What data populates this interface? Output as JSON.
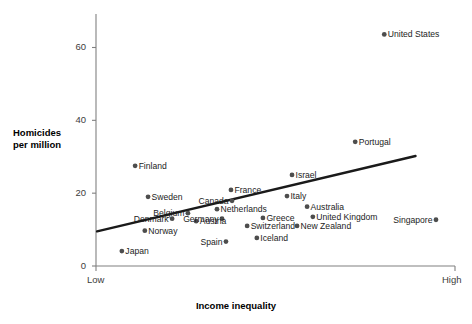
{
  "chart_data": {
    "type": "scatter",
    "title": "",
    "xlabel": "Income inequality",
    "ylabel": "Homicides\nper million",
    "ylabel_line1": "Homicides",
    "ylabel_line2": "per million",
    "x_tick_labels": [
      "Low",
      "High"
    ],
    "y_tick_labels": [
      "0",
      "20",
      "40",
      "60"
    ],
    "y_ticks": [
      0,
      20,
      40,
      60
    ],
    "ylim": [
      0,
      67
    ],
    "xlim": [
      0,
      100
    ],
    "grid": false,
    "legend": "none",
    "marker_color": "#4d4d4d",
    "trendline_color": "#1a1a1a",
    "axis_color": "#808080",
    "trendline": {
      "x_start": 0.3,
      "y_start": 9.5,
      "x_end": 89,
      "y_end": 30.2
    },
    "points": [
      {
        "label": "United States",
        "x": 80.3,
        "y": 63.6,
        "side": "right"
      },
      {
        "label": "Portugal",
        "x": 72.2,
        "y": 34.1,
        "side": "right"
      },
      {
        "label": "Finland",
        "x": 10.9,
        "y": 27.5,
        "side": "right"
      },
      {
        "label": "Israel",
        "x": 54.6,
        "y": 25.0,
        "side": "right"
      },
      {
        "label": "France",
        "x": 37.6,
        "y": 20.9,
        "side": "right"
      },
      {
        "label": "Sweden",
        "x": 14.5,
        "y": 19.0,
        "side": "right"
      },
      {
        "label": "Canada",
        "x": 37.9,
        "y": 17.9,
        "side": "left"
      },
      {
        "label": "Italy",
        "x": 53.2,
        "y": 19.2,
        "side": "right"
      },
      {
        "label": "Netherlands",
        "x": 33.7,
        "y": 15.6,
        "side": "right"
      },
      {
        "label": "Australia",
        "x": 58.8,
        "y": 16.3,
        "side": "right"
      },
      {
        "label": "Belgium",
        "x": 25.6,
        "y": 14.5,
        "side": "left"
      },
      {
        "label": "Denmark",
        "x": 21.2,
        "y": 13.0,
        "side": "left"
      },
      {
        "label": "Germany",
        "x": 35.1,
        "y": 13.0,
        "side": "left"
      },
      {
        "label": "Greece",
        "x": 46.5,
        "y": 13.2,
        "side": "right"
      },
      {
        "label": "United Kingdom",
        "x": 60.4,
        "y": 13.5,
        "side": "right"
      },
      {
        "label": "Singapore",
        "x": 94.7,
        "y": 12.7,
        "side": "left"
      },
      {
        "label": "Austria",
        "x": 27.9,
        "y": 12.3,
        "side": "right"
      },
      {
        "label": "Switzerland",
        "x": 42.1,
        "y": 11.0,
        "side": "right"
      },
      {
        "label": "New Zealand",
        "x": 56.0,
        "y": 11.0,
        "side": "right"
      },
      {
        "label": "Norway",
        "x": 13.6,
        "y": 9.7,
        "side": "right"
      },
      {
        "label": "Spain",
        "x": 36.2,
        "y": 6.7,
        "side": "left"
      },
      {
        "label": "Iceland",
        "x": 44.8,
        "y": 7.7,
        "side": "right"
      },
      {
        "label": "Japan",
        "x": 7.2,
        "y": 4.1,
        "side": "right"
      }
    ]
  }
}
